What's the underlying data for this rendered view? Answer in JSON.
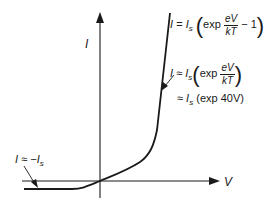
{
  "diagram": {
    "type": "diode I-V characteristic",
    "axes": {
      "y_label": "I",
      "x_label": "V"
    },
    "equations": {
      "full": {
        "lhs": "I",
        "eq": "=",
        "is": "I",
        "is_sub": "s",
        "exp": "exp",
        "num": "eV",
        "den": "kT",
        "minus_one": "− 1"
      },
      "approx": {
        "lhs": "I",
        "eq": "≈",
        "is": "I",
        "is_sub": "s",
        "exp": "exp",
        "num": "eV",
        "den": "kT"
      },
      "numeric": {
        "eq": "≈",
        "is": "I",
        "is_sub": "s",
        "rest": "(exp 40V)"
      },
      "reverse": {
        "lhs": "I",
        "eq": "≈",
        "rhs": "−I",
        "rhs_sub": "s"
      }
    },
    "colors": {
      "line": "#1a1a1a",
      "background": "#ffffff"
    }
  }
}
